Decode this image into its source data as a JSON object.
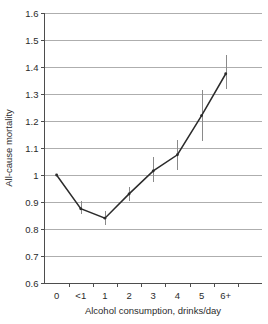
{
  "chart_data": {
    "type": "line",
    "title": "",
    "subtitle": "",
    "xlabel": "Alcohol consumption, drinks/day",
    "ylabel": "All-cause mortality",
    "categories": [
      "0",
      "<1",
      "1",
      "2",
      "3",
      "4",
      "5",
      "6+"
    ],
    "values": [
      1.0,
      0.875,
      0.84,
      0.93,
      1.015,
      1.075,
      1.22,
      1.375
    ],
    "error_low": [
      1.0,
      0.855,
      0.815,
      0.905,
      0.975,
      1.02,
      1.125,
      1.32
    ],
    "error_high": [
      1.0,
      0.905,
      0.865,
      0.955,
      1.065,
      1.13,
      1.315,
      1.445
    ],
    "series": [
      {
        "name": "All-cause mortality",
        "values": [
          1.0,
          0.875,
          0.84,
          0.93,
          1.015,
          1.075,
          1.22,
          1.375
        ]
      }
    ],
    "ylim": [
      0.6,
      1.6
    ],
    "ytick_step": 0.1,
    "ytick_labels": [
      "1.6",
      "1.5",
      "1.4",
      "1.3",
      "1.2",
      "1.1",
      "1",
      "0.9",
      "0.8",
      "0.7",
      "0.6"
    ],
    "ytick_values": [
      1.6,
      1.5,
      1.4,
      1.3,
      1.2,
      1.1,
      1.0,
      0.9,
      0.8,
      0.7,
      0.6
    ],
    "grid": true,
    "grid_axis": "y",
    "legend": false,
    "legend_position": "none",
    "marker": "point",
    "line_color": "#2b2b2b",
    "errorbar_color": "#8a8a8a",
    "grid_color": "#8c8c8c",
    "axis_color": "#4d4d4d",
    "background_color": "#ffffff",
    "reference_value": 1.0,
    "annotations": []
  },
  "figure": {
    "background_color": "#ffffff",
    "caption_fragment": ""
  }
}
